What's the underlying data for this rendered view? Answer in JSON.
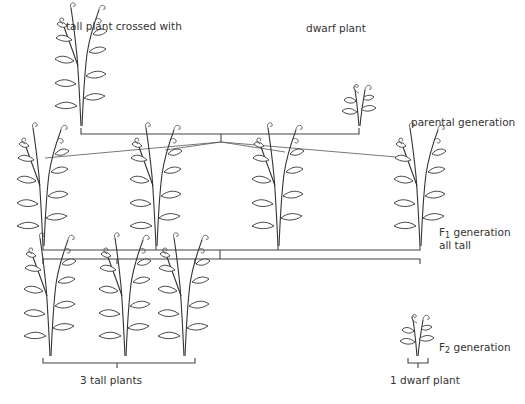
{
  "labels": {
    "tall_parent": "tall plant crossed with",
    "dwarf_parent": "dwarf plant",
    "parental_generation": "parental generation",
    "f1_prefix": "F",
    "f1_sub": "1",
    "f1_suffix": " generation",
    "f1_note": "all tall",
    "f2_prefix": "F",
    "f2_sub": "2",
    "f2_suffix": " generation",
    "f2_tall_count": "3 tall plants",
    "f2_dwarf_count": "1 dwarf plant"
  },
  "generations": [
    {
      "name": "parental",
      "plants": [
        {
          "type": "tall",
          "x": 81
        },
        {
          "type": "dwarf",
          "x": 359
        }
      ]
    },
    {
      "name": "F1",
      "plants": [
        {
          "type": "tall",
          "x": 43
        },
        {
          "type": "tall",
          "x": 156
        },
        {
          "type": "tall",
          "x": 278
        },
        {
          "type": "tall",
          "x": 420
        }
      ]
    },
    {
      "name": "F2",
      "plants": [
        {
          "type": "tall",
          "x": 43
        },
        {
          "type": "tall",
          "x": 117
        },
        {
          "type": "tall",
          "x": 195
        },
        {
          "type": "dwarf",
          "x": 420
        }
      ]
    }
  ],
  "ratio": {
    "tall": 3,
    "dwarf": 1
  }
}
